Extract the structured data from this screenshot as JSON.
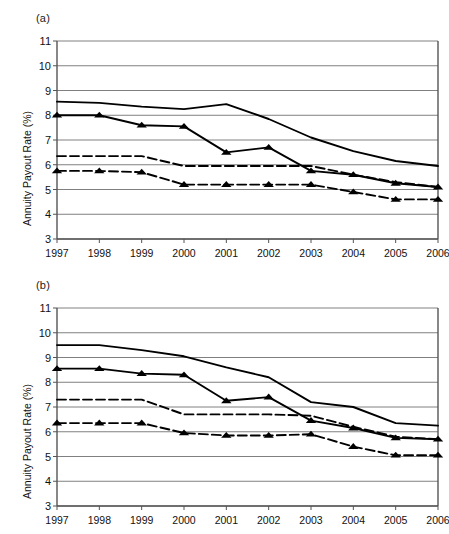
{
  "figure": {
    "panels": [
      {
        "tag": "(a)",
        "ylabel": "Annuity Payout Rate (%)",
        "chart_data": {
          "type": "line",
          "title": "",
          "xlabel": "",
          "ylabel": "Annuity Payout Rate (%)",
          "categories": [
            "1997",
            "1998",
            "1999",
            "2000",
            "2001",
            "2002",
            "2003",
            "2004",
            "2005",
            "2006"
          ],
          "x": [
            1997,
            1998,
            1999,
            2000,
            2001,
            2002,
            2003,
            2004,
            2005,
            2006
          ],
          "ylim": [
            3,
            11
          ],
          "yticks": [
            3,
            4,
            5,
            6,
            7,
            8,
            9,
            10,
            11
          ],
          "grid": "horizontal",
          "legend": "none",
          "series": [
            {
              "name": "solid-no-marker-upper",
              "style": "solid",
              "marker": "none",
              "values": [
                8.55,
                8.5,
                8.35,
                8.25,
                8.45,
                7.85,
                7.1,
                6.55,
                6.15,
                5.95
              ]
            },
            {
              "name": "solid-triangle-marker",
              "style": "solid",
              "marker": "triangle",
              "values": [
                8.0,
                8.0,
                7.6,
                7.55,
                6.5,
                6.7,
                5.75,
                5.6,
                5.25,
                5.1
              ]
            },
            {
              "name": "dashed-no-marker",
              "style": "dashed",
              "marker": "none",
              "values": [
                6.35,
                6.35,
                6.35,
                5.95,
                5.95,
                5.95,
                5.95,
                5.6,
                5.3,
                5.1
              ]
            },
            {
              "name": "dashed-triangle-marker",
              "style": "dashed",
              "marker": "triangle",
              "values": [
                5.75,
                5.75,
                5.7,
                5.2,
                5.2,
                5.2,
                5.2,
                4.9,
                4.6,
                4.6
              ]
            }
          ]
        }
      },
      {
        "tag": "(b)",
        "ylabel": "Annuity  Payout  Rate (%)",
        "chart_data": {
          "type": "line",
          "title": "",
          "xlabel": "",
          "ylabel": "Annuity  Payout  Rate (%)",
          "categories": [
            "1997",
            "1998",
            "1999",
            "2000",
            "2001",
            "2002",
            "2003",
            "2004",
            "2005",
            "2006"
          ],
          "x": [
            1997,
            1998,
            1999,
            2000,
            2001,
            2002,
            2003,
            2004,
            2005,
            2006
          ],
          "ylim": [
            3,
            11
          ],
          "yticks": [
            3,
            4,
            5,
            6,
            7,
            8,
            9,
            10,
            11
          ],
          "grid": "horizontal",
          "legend": "none",
          "series": [
            {
              "name": "solid-no-marker-upper",
              "style": "solid",
              "marker": "none",
              "values": [
                9.5,
                9.5,
                9.3,
                9.05,
                8.6,
                8.2,
                7.2,
                7.0,
                6.35,
                6.25
              ]
            },
            {
              "name": "solid-triangle-marker",
              "style": "solid",
              "marker": "triangle",
              "values": [
                8.55,
                8.55,
                8.35,
                8.3,
                7.25,
                7.4,
                6.45,
                6.15,
                5.75,
                5.7
              ]
            },
            {
              "name": "dashed-no-marker",
              "style": "dashed",
              "marker": "none",
              "values": [
                7.3,
                7.3,
                7.3,
                6.7,
                6.7,
                6.7,
                6.65,
                6.2,
                5.8,
                5.7
              ]
            },
            {
              "name": "dashed-triangle-marker",
              "style": "dashed",
              "marker": "triangle",
              "values": [
                6.35,
                6.35,
                6.35,
                5.95,
                5.85,
                5.85,
                5.9,
                5.4,
                5.05,
                5.05
              ]
            }
          ]
        }
      }
    ]
  }
}
